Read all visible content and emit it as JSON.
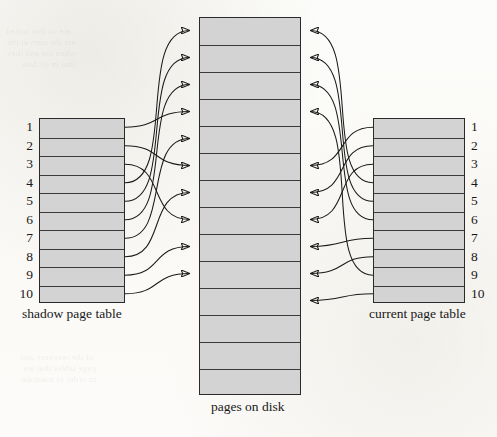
{
  "figure": {
    "caption_center": "pages on disk",
    "caption_left": "shadow page table",
    "caption_right": "current page table"
  },
  "colors": {
    "page_fill": "#d3d3d3",
    "border": "#2a2a2a",
    "arrow": "#1a1a1a",
    "background": "#fdfdfb",
    "text": "#181818"
  },
  "shadow_page_table": {
    "label": "shadow page table",
    "entry_count": 10,
    "entries": [
      {
        "index": "1"
      },
      {
        "index": "2"
      },
      {
        "index": "3"
      },
      {
        "index": "4"
      },
      {
        "index": "5"
      },
      {
        "index": "6"
      },
      {
        "index": "7"
      },
      {
        "index": "8"
      },
      {
        "index": "9"
      },
      {
        "index": "10"
      }
    ]
  },
  "current_page_table": {
    "label": "current page table",
    "entry_count": 10,
    "entries": [
      {
        "index": "1"
      },
      {
        "index": "2"
      },
      {
        "index": "3"
      },
      {
        "index": "4"
      },
      {
        "index": "5"
      },
      {
        "index": "6"
      },
      {
        "index": "7"
      },
      {
        "index": "8"
      },
      {
        "index": "9"
      },
      {
        "index": "10"
      }
    ]
  },
  "pages_on_disk": {
    "label": "pages on disk",
    "slot_count": 14,
    "slots": [
      "",
      "",
      "",
      "",
      "",
      "",
      "",
      "",
      "",
      "",
      "",
      "",
      "",
      ""
    ]
  },
  "chart_data": {
    "type": "diagram",
    "nodes": [
      {
        "id": "shadow",
        "label": "shadow page table",
        "entries": 10,
        "side": "left"
      },
      {
        "id": "disk",
        "label": "pages on disk",
        "slots": 14,
        "side": "center"
      },
      {
        "id": "current",
        "label": "current page table",
        "entries": 10,
        "side": "right"
      }
    ],
    "edges_shadow_to_disk": [
      {
        "from_entry": 1,
        "to_slot": 4
      },
      {
        "from_entry": 2,
        "to_slot": 6
      },
      {
        "from_entry": 3,
        "to_slot": 8
      },
      {
        "from_entry": 4,
        "to_slot": 1
      },
      {
        "from_entry": 5,
        "to_slot": 2
      },
      {
        "from_entry": 6,
        "to_slot": 3
      },
      {
        "from_entry": 7,
        "to_slot": 5
      },
      {
        "from_entry": 8,
        "to_slot": 7
      },
      {
        "from_entry": 9,
        "to_slot": 9
      },
      {
        "from_entry": 10,
        "to_slot": 10
      }
    ],
    "edges_current_to_disk": [
      {
        "from_entry": 1,
        "to_slot": 6
      },
      {
        "from_entry": 2,
        "to_slot": 7
      },
      {
        "from_entry": 3,
        "to_slot": 8
      },
      {
        "from_entry": 4,
        "to_slot": 1
      },
      {
        "from_entry": 5,
        "to_slot": 2
      },
      {
        "from_entry": 6,
        "to_slot": 3
      },
      {
        "from_entry": 7,
        "to_slot": 9
      },
      {
        "from_entry": 8,
        "to_slot": 10
      },
      {
        "from_entry": 9,
        "to_slot": 4
      },
      {
        "from_entry": 10,
        "to_slot": 11
      }
    ],
    "arrow_direction": "page tables point into pages on disk"
  }
}
